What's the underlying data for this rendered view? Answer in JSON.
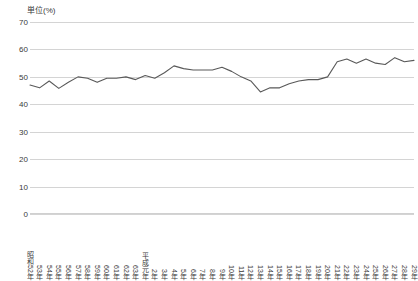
{
  "unit_label": "単位(%)",
  "axis": {
    "y_ticks": [
      70,
      60,
      50,
      40,
      30,
      20,
      10,
      0
    ],
    "y_min": 0,
    "y_max": 70
  },
  "chart_data": {
    "type": "line",
    "title": "単位(%)",
    "subtitle": "",
    "xlabel": "",
    "ylabel": "単位(%)",
    "ylim": [
      0,
      70
    ],
    "yticks": [
      0,
      10,
      20,
      30,
      40,
      50,
      60,
      70
    ],
    "grid": true,
    "legend": "none",
    "line_color": "#595959",
    "categories": [
      "昭和52年",
      "53年",
      "54年",
      "55年",
      "56年",
      "57年",
      "58年",
      "59年",
      "60年",
      "61年",
      "62年",
      "63年",
      "平成元年",
      "2年",
      "3年",
      "4年",
      "5年",
      "6年",
      "7年",
      "8年",
      "9年",
      "10年",
      "11年",
      "12年",
      "13年",
      "14年",
      "15年",
      "16年",
      "17年",
      "18年",
      "19年",
      "20年",
      "21年",
      "22年",
      "23年",
      "24年",
      "25年",
      "26年",
      "27年",
      "28年",
      "29年"
    ],
    "values": [
      47.0,
      46.0,
      48.5,
      45.8,
      48.0,
      50.0,
      49.5,
      48.0,
      49.5,
      49.5,
      50.0,
      49.0,
      50.5,
      49.5,
      51.5,
      54.0,
      53.0,
      52.5,
      52.5,
      52.5,
      53.5,
      52.0,
      50.0,
      48.5,
      44.5,
      46.0,
      46.0,
      47.5,
      48.5,
      49.0,
      49.0,
      50.0,
      55.5,
      56.5,
      55.0,
      56.5,
      55.0,
      54.5,
      57.0,
      55.5,
      56.0
    ]
  }
}
